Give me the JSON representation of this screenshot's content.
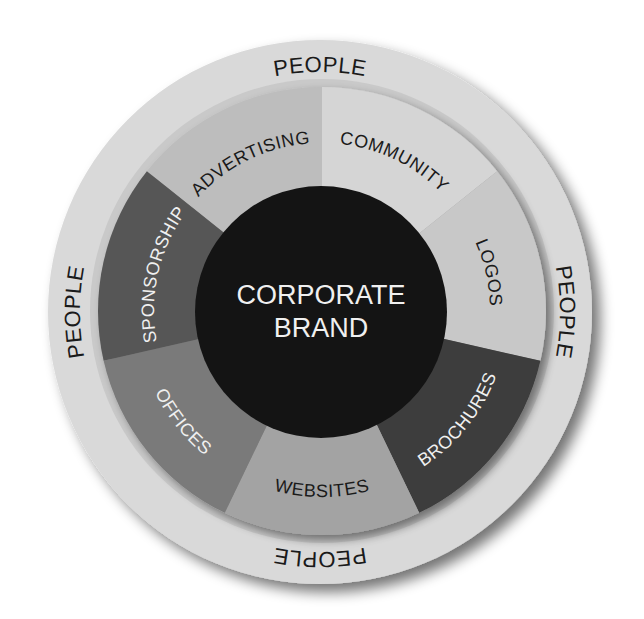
{
  "diagram": {
    "center": {
      "line1": "CORPORATE",
      "line2": "BRAND",
      "fill": "#141414",
      "text_color": "#f0f0f0"
    },
    "outer_ring": {
      "label": "PEOPLE",
      "labels": [
        "PEOPLE",
        "PEOPLE",
        "PEOPLE",
        "PEOPLE"
      ],
      "positions": [
        "top",
        "right",
        "bottom",
        "left"
      ],
      "fill": "#d9d9d9",
      "inner_band": "#c9c9c9"
    },
    "segments": [
      {
        "label": "ADVERTISING",
        "fill": "#bdbdbd",
        "text_color": "#1a1a1a"
      },
      {
        "label": "COMMUNITY",
        "fill": "#d5d5d5",
        "text_color": "#1a1a1a"
      },
      {
        "label": "LOGOS",
        "fill": "#c8c8c8",
        "text_color": "#1a1a1a"
      },
      {
        "label": "BROCHURES",
        "fill": "#3c3c3c",
        "text_color": "#f0f0f0"
      },
      {
        "label": "WEBSITES",
        "fill": "#a3a3a3",
        "text_color": "#1a1a1a"
      },
      {
        "label": "OFFICES",
        "fill": "#7a7a7a",
        "text_color": "#f0f0f0"
      },
      {
        "label": "SPONSORSHIP",
        "fill": "#575757",
        "text_color": "#f0f0f0"
      }
    ]
  }
}
